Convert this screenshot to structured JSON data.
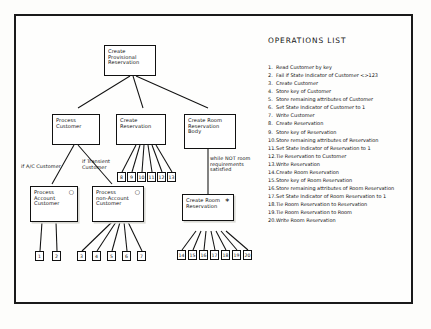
{
  "diagram": {
    "nodes": {
      "root": {
        "label": "Create\nProvisional\nReservation",
        "marker": ""
      },
      "process_customer": {
        "label": "Process\nCustomer",
        "marker": ""
      },
      "create_reservation": {
        "label": "Create\nReservation",
        "marker": ""
      },
      "create_room_reservation_body": {
        "label": "Create Room\nReservation\nBody",
        "marker": ""
      },
      "process_account_customer": {
        "label": "Process\nAccount\nCustomer",
        "marker": "○"
      },
      "process_non_account_customer": {
        "label": "Process\nnon-Account\nCustomer",
        "marker": "○"
      },
      "create_room_reservation": {
        "label": "Create Room\nReservation",
        "marker": "∗"
      }
    },
    "labels": {
      "if_ac_customer": "if A/C Customer",
      "if_transient_customer": "if Transient\nCustomer",
      "while_not_room": "while NOT room\nrequirements\nsatisfied"
    },
    "leaves": {
      "process_account_customer": [
        "1",
        "2"
      ],
      "process_non_account_customer": [
        "3",
        "4",
        "5",
        "6",
        "7"
      ],
      "create_reservation": [
        "8",
        "9",
        "10",
        "11",
        "12",
        "13"
      ],
      "create_room_reservation": [
        "14",
        "15",
        "16",
        "17",
        "18",
        "19",
        "20"
      ]
    }
  },
  "operations": {
    "title": "OPERATIONS LIST",
    "items": [
      {
        "n": "1.",
        "text": "Read Customer by key"
      },
      {
        "n": "2.",
        "text": "Fail if State Indicator of Customer <>123"
      },
      {
        "n": "3.",
        "text": "Create Customer"
      },
      {
        "n": "4.",
        "text": "Store key of Customer"
      },
      {
        "n": "5.",
        "text": "Store remaining attributes of Customer"
      },
      {
        "n": "6.",
        "text": "Set State Indicator of Customer to 1"
      },
      {
        "n": "7.",
        "text": "Write Customer"
      },
      {
        "n": "8.",
        "text": "Create Reservation"
      },
      {
        "n": "9.",
        "text": "Store key of Reservation"
      },
      {
        "n": "10.",
        "text": "Store remaining attributes of Reservation"
      },
      {
        "n": "11.",
        "text": "Set State Indicator of Reservation to 1"
      },
      {
        "n": "12.",
        "text": "Tie Reservation to Customer"
      },
      {
        "n": "13.",
        "text": "Write Reservation"
      },
      {
        "n": "14.",
        "text": "Create Room Reservation"
      },
      {
        "n": "15.",
        "text": "Store key of Room Reservation"
      },
      {
        "n": "16.",
        "text": "Store remaining attributes of Room Reservation"
      },
      {
        "n": "17.",
        "text": "Set State Indicator of Room Reservation to 1"
      },
      {
        "n": "18.",
        "text": "Tie Room Reservation to Reservation"
      },
      {
        "n": "19.",
        "text": "Tie Room Reservation to Room"
      },
      {
        "n": "20.",
        "text": "Write Room Reservation"
      }
    ]
  }
}
